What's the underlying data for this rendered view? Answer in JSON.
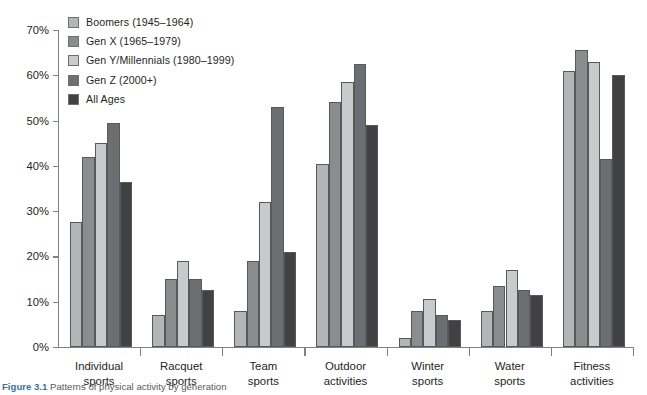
{
  "figure": {
    "caption_number": "Figure 3.1",
    "caption_text": "Patterns of physical activity by generation"
  },
  "legend": {
    "position": "top-left",
    "items": [
      {
        "label": "Boomers (1945–1964)",
        "color": "#b4b5b7"
      },
      {
        "label": "Gen X (1965–1979)",
        "color": "#8a8c8e"
      },
      {
        "label": "Gen Y/Millennials (1980–1999)",
        "color": "#c9cacc"
      },
      {
        "label": "Gen Z (2000+)",
        "color": "#6d6e71"
      },
      {
        "label": "All Ages",
        "color": "#414042"
      }
    ]
  },
  "axis": {
    "y_ticks": [
      "0%",
      "10%",
      "20%",
      "30%",
      "40%",
      "50%",
      "60%",
      "70%"
    ],
    "y_min": 0,
    "y_max": 70
  },
  "chart_data": {
    "type": "bar",
    "title": "",
    "xlabel": "",
    "ylabel": "",
    "ylim": [
      0,
      70
    ],
    "ytick_values": [
      0,
      10,
      20,
      30,
      40,
      50,
      60,
      70
    ],
    "grid": false,
    "legend_position": "top-left",
    "categories": [
      "Individual sports",
      "Racquet sports",
      "Team sports",
      "Outdoor activities",
      "Winter sports",
      "Water sports",
      "Fitness activities"
    ],
    "category_lines": [
      [
        "Individual",
        "sports"
      ],
      [
        "Racquet",
        "sports"
      ],
      [
        "Team",
        "sports"
      ],
      [
        "Outdoor",
        "activities"
      ],
      [
        "Winter",
        "sports"
      ],
      [
        "Water",
        "sports"
      ],
      [
        "Fitness",
        "activities"
      ]
    ],
    "series": [
      {
        "name": "Boomers (1945–1964)",
        "color": "#b4b5b7",
        "values": [
          27.5,
          7.0,
          8.0,
          40.5,
          2.0,
          8.0,
          61.0
        ]
      },
      {
        "name": "Gen X (1965–1979)",
        "color": "#8a8c8e",
        "values": [
          42.0,
          15.0,
          19.0,
          54.0,
          8.0,
          13.5,
          65.5
        ]
      },
      {
        "name": "Gen Y/Millennials (1980–1999)",
        "color": "#c9cacc",
        "values": [
          45.0,
          19.0,
          32.0,
          58.5,
          10.5,
          17.0,
          63.0
        ]
      },
      {
        "name": "Gen Z (2000+)",
        "color": "#6d6e71",
        "values": [
          49.5,
          15.0,
          53.0,
          62.5,
          7.0,
          12.5,
          41.5
        ]
      },
      {
        "name": "All Ages",
        "color": "#414042",
        "values": [
          36.5,
          12.5,
          21.0,
          49.0,
          6.0,
          11.5,
          60.0
        ]
      }
    ]
  }
}
